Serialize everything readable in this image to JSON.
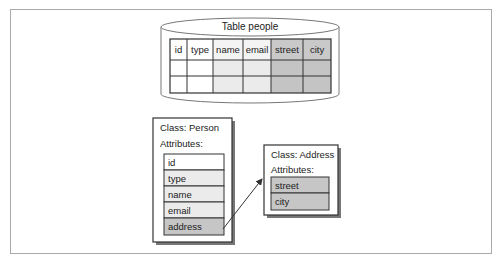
{
  "table": {
    "title": "Table people",
    "columns": [
      "id",
      "type",
      "name",
      "email",
      "street",
      "city"
    ],
    "rows": 2
  },
  "person_class": {
    "title": "Class: Person",
    "attributes_label": "Attributes:",
    "attributes": [
      "id",
      "type",
      "name",
      "email",
      "address"
    ]
  },
  "address_class": {
    "title": "Class: Address",
    "attributes_label": "Attributes:",
    "attributes": [
      "street",
      "city"
    ]
  },
  "colors": {
    "white_cell": "#ffffff",
    "light_cell": "#ebebeb",
    "dark_cell": "#c9c9c9",
    "border": "#333333",
    "frame": "#aaaaaa"
  }
}
